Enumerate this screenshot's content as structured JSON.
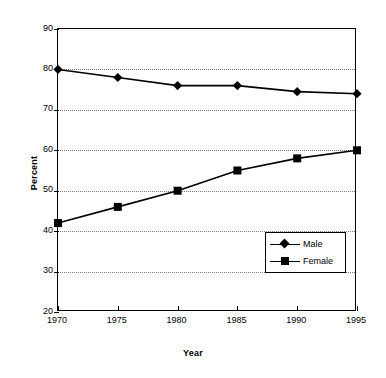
{
  "chart_data": {
    "type": "line",
    "title": "",
    "xlabel": "Year",
    "ylabel": "Percent",
    "categories": [
      "1970",
      "1975",
      "1980",
      "1985",
      "1990",
      "1995"
    ],
    "x": [
      1970,
      1975,
      1980,
      1985,
      1990,
      1995
    ],
    "xlim": [
      1970,
      1995
    ],
    "ylim": [
      20,
      90
    ],
    "yticks": [
      90,
      80,
      70,
      60,
      50,
      40,
      30,
      20
    ],
    "ytick_labels": [
      "90",
      "80",
      "70",
      "60",
      "50",
      "40",
      "30",
      "20"
    ],
    "grid": "horizontal-dotted",
    "legend_position": "inner-lower-right",
    "series": [
      {
        "name": "Male",
        "marker": "diamond",
        "color": "#000000",
        "values": [
          80,
          78,
          76,
          76,
          74.5,
          74
        ]
      },
      {
        "name": "Female",
        "marker": "square",
        "color": "#000000",
        "values": [
          42,
          46,
          50,
          55,
          58,
          60
        ]
      }
    ]
  },
  "legend": {
    "items": [
      {
        "label": "Male",
        "marker": "diamond"
      },
      {
        "label": "Female",
        "marker": "square"
      }
    ]
  },
  "colors": {
    "ink": "#000000",
    "paper": "#ffffff",
    "grid": "#777777"
  }
}
